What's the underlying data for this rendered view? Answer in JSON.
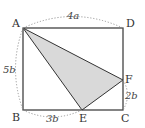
{
  "figure": {
    "type": "geometry",
    "colors": {
      "stroke": "#333333",
      "shade": "#d9d9d9",
      "dotted": "#999999",
      "background": "#ffffff"
    },
    "points": {
      "A": {
        "label": "A",
        "x": 23,
        "y": 28
      },
      "B": {
        "label": "B",
        "x": 23,
        "y": 110
      },
      "C": {
        "label": "C",
        "x": 123,
        "y": 110
      },
      "D": {
        "label": "D",
        "x": 123,
        "y": 28
      },
      "E": {
        "label": "E",
        "x": 82,
        "y": 110
      },
      "F": {
        "label": "F",
        "x": 123,
        "y": 80
      }
    },
    "dimensions": {
      "AD": "4a",
      "AB": "5b",
      "BE": "3b",
      "FC": "2b"
    },
    "shaded_region": [
      "A",
      "E",
      "F"
    ]
  }
}
